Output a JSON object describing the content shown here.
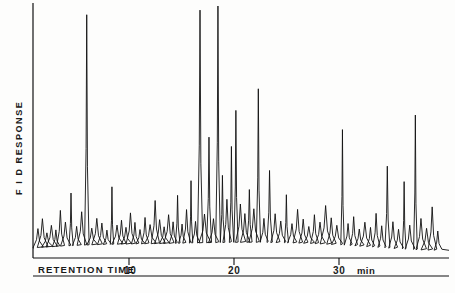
{
  "figure": {
    "kind": "gas-chromatogram",
    "background_color": "#fdfdfc",
    "trace_color": "#111111"
  },
  "axes": {
    "y_axis_label": "F I D RESPONSE",
    "x_axis_label": "RETENTION TIME",
    "x_unit": "min",
    "x_ticks": [
      {
        "label": "10",
        "value": 10
      },
      {
        "label": "20",
        "value": 20
      },
      {
        "label": "30",
        "value": 30
      }
    ]
  },
  "chart_data": {
    "type": "line",
    "title": "",
    "xlabel": "RETENTION TIME (min)",
    "ylabel": "F I D RESPONSE",
    "xlim": [
      0,
      37
    ],
    "ylim": [
      0,
      100
    ],
    "grid": false,
    "legend": null,
    "x_ticks": [
      10,
      20,
      30
    ],
    "x_tick_labels": [
      "10",
      "20",
      "30"
    ],
    "y_ticks": [],
    "y_tick_labels": [],
    "series": [
      {
        "name": "FID signal",
        "peaks_rt": [
          0.35,
          0.75,
          1.15,
          1.55,
          1.95,
          2.35,
          2.8,
          3.3,
          3.8,
          4.25,
          4.7,
          5.15,
          5.6,
          6.05,
          6.5,
          6.95,
          7.4,
          7.8,
          8.2,
          8.6,
          9.0,
          9.45,
          9.9,
          10.35,
          10.8,
          11.2,
          11.6,
          12.0,
          12.4,
          12.8,
          13.2,
          13.6,
          14.0,
          14.4,
          14.8,
          15.2,
          15.6,
          16.0,
          16.4,
          16.8,
          17.2,
          17.6,
          18.0,
          18.4,
          18.8,
          19.2,
          19.6,
          20.0,
          20.5,
          21.0,
          21.5,
          22.0,
          22.5,
          23.0,
          23.5,
          24.0,
          24.5,
          25.0,
          25.5,
          26.0,
          26.5,
          27.0,
          27.5,
          28.0,
          28.5,
          29.0,
          29.5,
          30.0,
          30.5,
          31.0,
          31.5,
          32.0,
          32.5,
          33.0,
          33.5,
          34.0,
          34.5,
          35.0,
          35.5,
          36.0
        ],
        "peaks_height": [
          8,
          12,
          6,
          9,
          7,
          15,
          10,
          22,
          8,
          14,
          96,
          7,
          11,
          9,
          6,
          24,
          8,
          10,
          7,
          13,
          9,
          6,
          11,
          8,
          18,
          10,
          7,
          12,
          9,
          20,
          8,
          14,
          26,
          9,
          97,
          12,
          44,
          10,
          99,
          28,
          18,
          40,
          55,
          16,
          12,
          22,
          14,
          64,
          10,
          30,
          12,
          9,
          20,
          8,
          14,
          10,
          7,
          12,
          9,
          16,
          11,
          8,
          48,
          9,
          12,
          7,
          10,
          8,
          14,
          9,
          34,
          11,
          8,
          28,
          10,
          56,
          13,
          9,
          18,
          8
        ]
      }
    ]
  }
}
